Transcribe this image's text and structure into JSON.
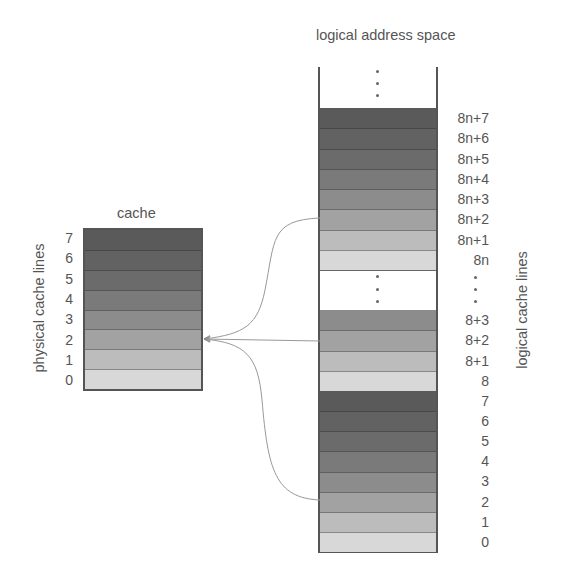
{
  "cache": {
    "title": "cache",
    "axis_label": "physical cache lines",
    "lines": [
      "7",
      "6",
      "5",
      "4",
      "3",
      "2",
      "1",
      "0"
    ]
  },
  "logical": {
    "title": "logical address space",
    "axis_label": "logical cache lines",
    "group_top": [
      "8n+7",
      "8n+6",
      "8n+5",
      "8n+4",
      "8n+3",
      "8n+2",
      "8n+1",
      "8n"
    ],
    "group_mid": [
      "8+3",
      "8+2",
      "8+1",
      "8"
    ],
    "group_bottom": [
      "7",
      "6",
      "5",
      "4",
      "3",
      "2",
      "1",
      "0"
    ],
    "ellipsis": "⋮"
  },
  "shades": [
    "#5a5a5a",
    "#626262",
    "#6b6b6b",
    "#7a7a7a",
    "#8c8c8c",
    "#a2a2a2",
    "#bcbcbc",
    "#d8d8d8"
  ],
  "border_color": "#555555",
  "arrows": [
    {
      "from": "8n+2",
      "to": "cache line 2"
    },
    {
      "from": "8+2",
      "to": "cache line 2"
    },
    {
      "from": "2",
      "to": "cache line 2"
    }
  ]
}
